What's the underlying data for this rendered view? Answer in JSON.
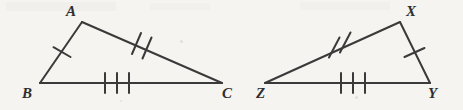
{
  "figure": {
    "kind": "geometry-diagram",
    "width": 463,
    "height": 110,
    "background_color": "#f5f4f1",
    "stroke_color": "#3a3a3a",
    "label_color": "#2e2e2e",
    "stroke_width": 2,
    "tick_stroke_width": 2
  },
  "triangles": [
    {
      "name": "triangle-abc",
      "vertices": [
        {
          "label": "A",
          "x": 82,
          "y": 22,
          "label_x": 66,
          "label_y": 4
        },
        {
          "label": "B",
          "x": 40,
          "y": 83,
          "label_x": 22,
          "label_y": 86
        },
        {
          "label": "C",
          "x": 222,
          "y": 83,
          "label_x": 222,
          "label_y": 86
        }
      ],
      "sides": [
        {
          "name": "side-ab",
          "from": "A",
          "to": "B",
          "ticks": 1
        },
        {
          "name": "side-ac",
          "from": "A",
          "to": "C",
          "ticks": 2
        },
        {
          "name": "side-bc",
          "from": "B",
          "to": "C",
          "ticks": 3
        }
      ]
    },
    {
      "name": "triangle-xyz",
      "vertices": [
        {
          "label": "X",
          "x": 400,
          "y": 22,
          "label_x": 406,
          "label_y": 4
        },
        {
          "label": "Z",
          "x": 265,
          "y": 83,
          "label_x": 256,
          "label_y": 86
        },
        {
          "label": "Y",
          "x": 430,
          "y": 83,
          "label_x": 428,
          "label_y": 86
        }
      ],
      "sides": [
        {
          "name": "side-xy",
          "from": "X",
          "to": "Y",
          "ticks": 1
        },
        {
          "name": "side-zx",
          "from": "Z",
          "to": "X",
          "ticks": 2
        },
        {
          "name": "side-zy",
          "from": "Z",
          "to": "Y",
          "ticks": 3
        }
      ]
    }
  ],
  "labels": {
    "a": "A",
    "b": "B",
    "c": "C",
    "x": "X",
    "y": "Y",
    "z": "Z"
  }
}
